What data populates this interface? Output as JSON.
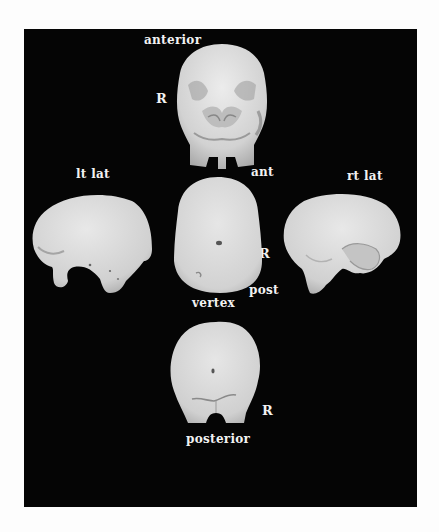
{
  "figure": {
    "background_color": "#050505",
    "surface_color": "#d9d9d9",
    "views": [
      {
        "id": "anterior",
        "title": "anterior",
        "side_marker": "R"
      },
      {
        "id": "left-lateral",
        "title": "lt lat"
      },
      {
        "id": "vertex",
        "title": "vertex",
        "top_marker": "ant",
        "side_marker": "R",
        "bottom_marker": "post"
      },
      {
        "id": "right-lateral",
        "title": "rt lat"
      },
      {
        "id": "posterior",
        "title": "posterior",
        "side_marker": "R"
      }
    ]
  }
}
